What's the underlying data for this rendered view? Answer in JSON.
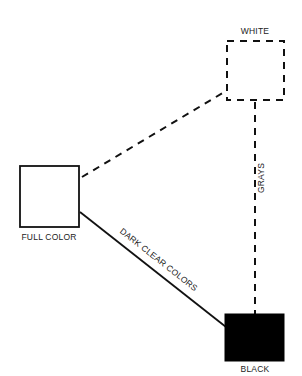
{
  "diagram": {
    "nodes": [
      {
        "id": "white",
        "label": "WHITE",
        "fill": "#ffffff",
        "border": "dashed"
      },
      {
        "id": "full_color",
        "label": "FULL COLOR",
        "fill": "#ffffff",
        "border": "solid"
      },
      {
        "id": "black",
        "label": "BLACK",
        "fill": "#000000",
        "border": "solid"
      }
    ],
    "edges": [
      {
        "from": "full_color",
        "to": "white",
        "style": "dashed",
        "label": ""
      },
      {
        "from": "full_color",
        "to": "black",
        "style": "solid",
        "label": "DARK CLEAR COLORS"
      },
      {
        "from": "white",
        "to": "black",
        "style": "dashed",
        "label": "GRAYS"
      }
    ]
  },
  "colors": {
    "line": "#111111",
    "black_fill": "#000000",
    "background": "#ffffff"
  }
}
